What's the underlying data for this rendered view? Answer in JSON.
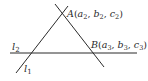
{
  "diagram": {
    "type": "geometry",
    "lines": [
      {
        "name": "l1",
        "label": "l",
        "subscript": "1",
        "from": [
          16,
          73
        ],
        "to": [
          68,
          6
        ]
      },
      {
        "name": "l2",
        "label": "l",
        "subscript": "2",
        "from": [
          10,
          53
        ],
        "to": [
          137,
          53
        ]
      },
      {
        "name": "AB-line",
        "from": [
          55,
          4
        ],
        "to": [
          104,
          67
        ]
      }
    ],
    "points": {
      "A": {
        "name": "A",
        "coords": [
          "a",
          "2",
          "b",
          "2",
          "c",
          "2"
        ],
        "position": [
          63,
          14
        ]
      },
      "B": {
        "name": "B",
        "coords": [
          "a",
          "3",
          "b",
          "3",
          "c",
          "3"
        ],
        "position": [
          92,
          53
        ]
      }
    },
    "labels": {
      "l1": {
        "main": "l",
        "sub": "1"
      },
      "l2": {
        "main": "l",
        "sub": "2"
      },
      "A": {
        "name": "A",
        "open": "(",
        "a": "a",
        "a_sub": "2",
        "sep1": ", ",
        "b": "b",
        "b_sub": "2",
        "sep2": ", ",
        "c": "c",
        "c_sub": "2",
        "close": ")"
      },
      "B": {
        "name": "B",
        "open": "(",
        "a": "a",
        "a_sub": "3",
        "sep1": ", ",
        "b": "b",
        "b_sub": "3",
        "sep2": ", ",
        "c": "c",
        "c_sub": "3",
        "close": ")"
      }
    },
    "colors": {
      "line": "#2a2a2a",
      "text": "#2a2a2a",
      "background": "#ffffff"
    }
  }
}
